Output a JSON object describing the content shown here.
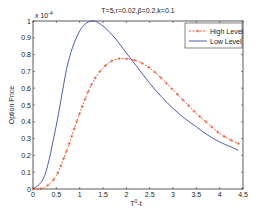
{
  "chart_data": {
    "type": "line",
    "title": "T=5,r=0.02,β=0.2,k=0.1",
    "xlabel": "T^0-t",
    "ylabel": "Option Price",
    "y_multiplier": "x 10^-4",
    "xlim": [
      0,
      4.5
    ],
    "ylim": [
      0,
      1
    ],
    "x_ticks": [
      "0",
      "0.5",
      "1",
      "1.5",
      "2",
      "2.5",
      "3",
      "3.5",
      "4",
      "4.5"
    ],
    "y_ticks": [
      "0",
      "0.1",
      "0.2",
      "0.3",
      "0.4",
      "0.5",
      "0.6",
      "0.7",
      "0.8",
      "0.9",
      "1"
    ],
    "grid": false,
    "legend_position": "upper right",
    "series": [
      {
        "name": "High Level",
        "color": "#e8502a",
        "style": "dotted-marker",
        "x": [
          0,
          0.25,
          0.5,
          0.75,
          1.0,
          1.25,
          1.5,
          1.75,
          2.0,
          2.25,
          2.5,
          2.75,
          3.0,
          3.25,
          3.5,
          3.75,
          4.0,
          4.25,
          4.4
        ],
        "values": [
          0,
          0.01,
          0.08,
          0.25,
          0.45,
          0.62,
          0.72,
          0.77,
          0.775,
          0.76,
          0.72,
          0.66,
          0.59,
          0.52,
          0.45,
          0.39,
          0.33,
          0.29,
          0.27
        ]
      },
      {
        "name": "Low Level",
        "color": "#3b4ba8",
        "style": "solid",
        "x": [
          0,
          0.25,
          0.5,
          0.75,
          1.0,
          1.25,
          1.5,
          1.75,
          2.0,
          2.25,
          2.5,
          2.75,
          3.0,
          3.25,
          3.5,
          3.75,
          4.0,
          4.25,
          4.4
        ],
        "values": [
          0,
          0.08,
          0.38,
          0.75,
          0.94,
          1.0,
          0.97,
          0.9,
          0.81,
          0.72,
          0.63,
          0.55,
          0.48,
          0.42,
          0.37,
          0.32,
          0.28,
          0.25,
          0.23
        ]
      }
    ]
  }
}
